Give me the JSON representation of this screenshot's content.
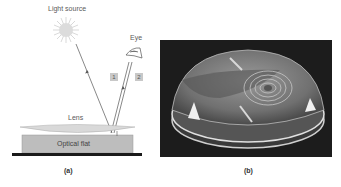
{
  "figure_a": {
    "caption": "(a)",
    "light_source_label": "Light source",
    "eye_label": "Eye",
    "ray_labels": [
      "1",
      "2"
    ],
    "lens_label": "Lens",
    "optical_flat_label": "Optical flat"
  },
  "figure_b": {
    "caption": "(b)",
    "description": "Photograph of a lens on an optical flat showing Newton's rings interference pattern"
  },
  "colors": {
    "lens_fill": "#d9d9d9",
    "flat_fill": "#bdbdbd",
    "base_line": "#1a1a1a",
    "sun": "#d0d0d0",
    "photo_bg": "#1c1c1c"
  }
}
